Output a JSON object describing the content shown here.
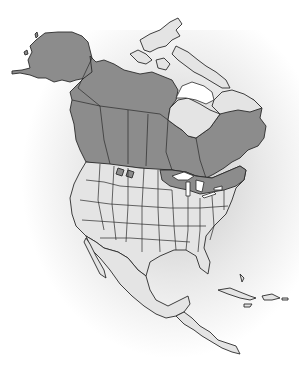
{
  "map": {
    "region": "North America",
    "style": "grayscale range map",
    "colors": {
      "range_fill": "#8c8c8c",
      "non_range_fill": "#e4e4e4",
      "outline": "#2a2a2a",
      "background": "#ffffff",
      "glow": "#b4b4b4"
    },
    "legend": {
      "range": "Shaded range (dark gray)",
      "other": "Outside range (light gray)"
    },
    "shaded_regions": [
      "Alaska",
      "Yukon",
      "Northwest Territories (southern)",
      "British Columbia",
      "Alberta",
      "Saskatchewan",
      "Manitoba",
      "Ontario",
      "Quebec (southern)",
      "Atlantic Canada",
      "Great Lakes region",
      "Northern Minnesota / Wisconsin / Michigan",
      "New York / New England (northern)",
      "Montana (patches)"
    ],
    "unshaded_regions": [
      "Arctic Archipelago",
      "Nunavut",
      "Northern Quebec / Labrador",
      "Hudson Bay lowlands",
      "Contiguous United States (most)",
      "Mexico",
      "Central America",
      "Caribbean islands"
    ]
  }
}
